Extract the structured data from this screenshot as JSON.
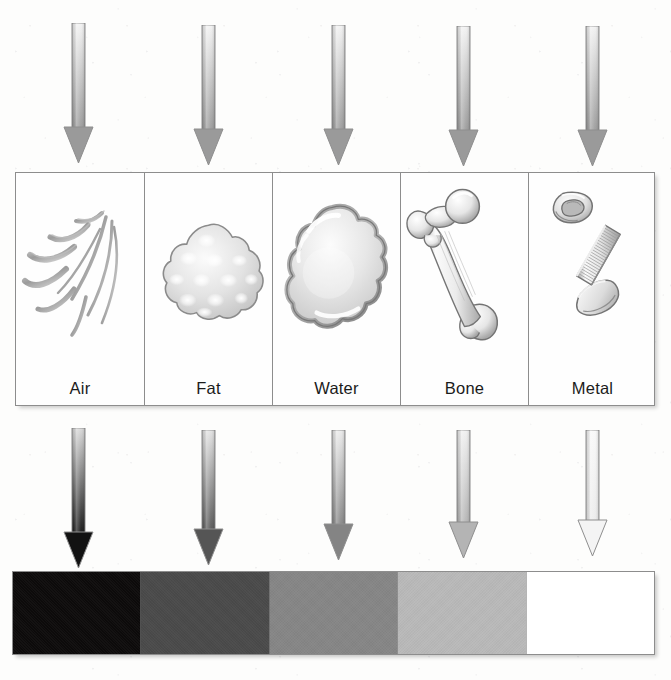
{
  "incident_beams": {
    "label": "incident x-ray beams",
    "arrows": [
      {
        "id": "incident-air",
        "target": "Air",
        "center_x": 78,
        "top": 23,
        "bottom": 163,
        "shaft_top_color": "#f2f2f2",
        "shaft_bottom_color": "#9a9a9a",
        "head_color": "#9a9a9a"
      },
      {
        "id": "incident-fat",
        "target": "Fat",
        "center_x": 208,
        "top": 25,
        "bottom": 165,
        "shaft_top_color": "#f2f2f2",
        "shaft_bottom_color": "#9a9a9a",
        "head_color": "#9a9a9a"
      },
      {
        "id": "incident-water",
        "target": "Water",
        "center_x": 338,
        "top": 25,
        "bottom": 165,
        "shaft_top_color": "#f2f2f2",
        "shaft_bottom_color": "#9a9a9a",
        "head_color": "#9a9a9a"
      },
      {
        "id": "incident-bone",
        "target": "Bone",
        "center_x": 463,
        "top": 26,
        "bottom": 166,
        "shaft_top_color": "#f2f2f2",
        "shaft_bottom_color": "#9a9a9a",
        "head_color": "#9a9a9a"
      },
      {
        "id": "incident-metal",
        "target": "Metal",
        "center_x": 592,
        "top": 26,
        "bottom": 166,
        "shaft_top_color": "#f2f2f2",
        "shaft_bottom_color": "#9a9a9a",
        "head_color": "#9a9a9a"
      }
    ]
  },
  "specimens": {
    "panel_label": "specimen row",
    "cells": [
      {
        "id": "cell-air",
        "label": "Air",
        "icon": "air-swirls-icon"
      },
      {
        "id": "cell-fat",
        "label": "Fat",
        "icon": "fat-blob-icon"
      },
      {
        "id": "cell-water",
        "label": "Water",
        "icon": "water-droplet-icon"
      },
      {
        "id": "cell-bone",
        "label": "Bone",
        "icon": "femur-bone-icon"
      },
      {
        "id": "cell-metal",
        "label": "Metal",
        "icon": "bolt-and-nut-icon"
      }
    ]
  },
  "transmitted_beams": {
    "label": "transmitted x-ray beams",
    "arrows": [
      {
        "id": "transmitted-air",
        "source": "Air",
        "center_x": 78,
        "top": 428,
        "bottom": 568,
        "shaft_top_color": "#d8d8d8",
        "shaft_bottom_color": "#121212",
        "head_color": "#121212",
        "intensity": "highest"
      },
      {
        "id": "transmitted-fat",
        "source": "Fat",
        "center_x": 208,
        "top": 430,
        "bottom": 565,
        "shaft_top_color": "#e2e2e2",
        "shaft_bottom_color": "#555555",
        "head_color": "#555555",
        "intensity": "high"
      },
      {
        "id": "transmitted-water",
        "source": "Water",
        "center_x": 338,
        "top": 430,
        "bottom": 560,
        "shaft_top_color": "#eaeaea",
        "shaft_bottom_color": "#848484",
        "head_color": "#848484",
        "intensity": "medium"
      },
      {
        "id": "transmitted-bone",
        "source": "Bone",
        "center_x": 463,
        "top": 430,
        "bottom": 558,
        "shaft_top_color": "#f0f0f0",
        "shaft_bottom_color": "#b4b4b4",
        "head_color": "#b4b4b4",
        "intensity": "low"
      },
      {
        "id": "transmitted-metal",
        "source": "Metal",
        "center_x": 592,
        "top": 430,
        "bottom": 556,
        "shaft_top_color": "#f8f8f8",
        "shaft_bottom_color": "#ebebeb",
        "head_color": "#f4f4f4",
        "intensity": "lowest"
      }
    ]
  },
  "film_strip": {
    "label": "resulting film density strip",
    "segments": [
      {
        "id": "film-air",
        "material": "Air",
        "color": "#0d0b0b",
        "density": "black"
      },
      {
        "id": "film-fat",
        "material": "Fat",
        "color": "#4a4a4a",
        "density": "dark gray"
      },
      {
        "id": "film-water",
        "material": "Water",
        "color": "#868686",
        "density": "medium gray"
      },
      {
        "id": "film-bone",
        "material": "Bone",
        "color": "#b9b9b9",
        "density": "light gray"
      },
      {
        "id": "film-metal",
        "material": "Metal",
        "color": "#ffffff",
        "density": "white"
      }
    ]
  },
  "colors": {
    "panel_border": "#8d8d8d",
    "ink": "#1b1b1b",
    "paper": "#fdfdfc",
    "art_line": "#6f6f6f"
  }
}
